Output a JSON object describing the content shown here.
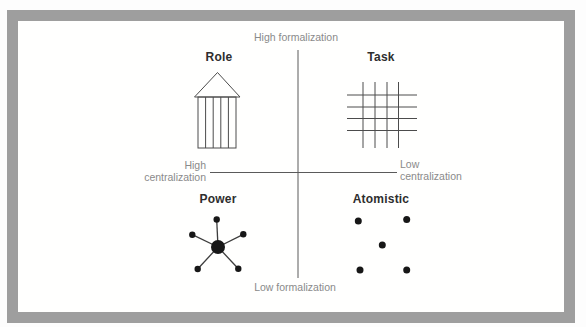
{
  "frame": {
    "border_color": "#9e9e9e",
    "background": "#fffffe"
  },
  "axis_labels": {
    "top": "High formalization",
    "bottom": "Low formalization",
    "left": {
      "line1": "High",
      "line2": "centralization"
    },
    "right": {
      "line1": "Low",
      "line2": "centralization"
    }
  },
  "quadrants": {
    "top_left": {
      "label": "Role",
      "icon": "temple-columns-icon"
    },
    "top_right": {
      "label": "Task",
      "icon": "grid-lattice-icon"
    },
    "bottom_left": {
      "label": "Power",
      "icon": "hub-spoke-icon"
    },
    "bottom_right": {
      "label": "Atomistic",
      "icon": "scattered-dots-icon"
    }
  },
  "diagram": {
    "colors": {
      "axis_line": "#5a5a5a",
      "shape_stroke": "#4c4c4c",
      "dot_fill": "#171717",
      "spoke_line": "#3d3d3d"
    },
    "axes": {
      "vertical": {
        "x": 298,
        "y1": 50,
        "y2": 278
      },
      "horizontal": {
        "y": 172.5,
        "x1": 210,
        "x2": 397
      }
    },
    "role_icon": {
      "triangle": [
        [
          194.5,
          97
        ],
        [
          217.5,
          72.5
        ],
        [
          240,
          97
        ]
      ],
      "rect": {
        "x": 198,
        "y": 97,
        "w": 38,
        "h": 51
      },
      "columns_x": [
        205.6,
        213.2,
        220.8,
        228.4
      ]
    },
    "task_icon": {
      "v_lines_x": [
        363,
        375,
        387,
        398.5
      ],
      "v_extent": [
        82,
        148
      ],
      "h_lines_y": [
        95,
        107,
        118.5,
        130.5
      ],
      "h_extent": [
        347,
        417
      ]
    },
    "power_icon": {
      "hub": {
        "x": 218,
        "y": 247,
        "r": 7
      },
      "satellite_r": 3.2,
      "satellites": [
        [
          216.7,
          219.5
        ],
        [
          192.3,
          234.7
        ],
        [
          243.3,
          234.3
        ],
        [
          197.7,
          269
        ],
        [
          238.3,
          268.7
        ]
      ]
    },
    "atomistic_icon": {
      "r": 3.5,
      "dots": [
        [
          358.3,
          221
        ],
        [
          406.7,
          219.5
        ],
        [
          382.3,
          245
        ],
        [
          360,
          270
        ],
        [
          406.7,
          270
        ]
      ]
    }
  }
}
